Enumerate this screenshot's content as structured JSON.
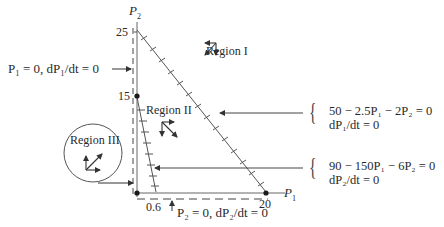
{
  "axes": {
    "y_label": "P",
    "y_label_sub": "2",
    "x_label": "P",
    "x_label_sub": "1",
    "y_ticks": [
      "25",
      "15"
    ],
    "x_ticks": [
      "0.6",
      "20"
    ]
  },
  "regions": {
    "region1": "Region I",
    "region2": "Region II",
    "region3": "Region III"
  },
  "annotations": {
    "p1_zero": "P₁ = 0, dP₁/dt = 0",
    "p2_zero": "P₂ = 0, dP₂/dt = 0"
  },
  "equations": {
    "eq1_line1": "50 − 2.5P₁ − 2P₂ = 0",
    "eq1_line2": "dP₁/dt = 0",
    "eq2_line1": "90 − 150P₁ − 6P₂ = 0",
    "eq2_line2": "dP₂/dt = 0"
  },
  "colors": {
    "line": "#555555",
    "text": "#2a2a2a",
    "point": "#1a1a1a"
  }
}
